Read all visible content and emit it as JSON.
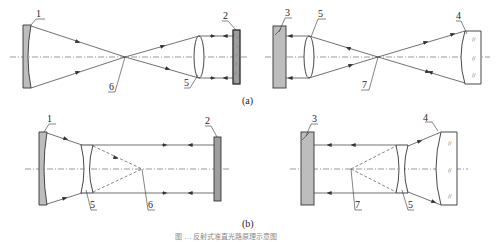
{
  "figure": {
    "subfigures": [
      {
        "id": "a",
        "label": "(a)",
        "left": {
          "labels": {
            "mirror": "1",
            "plate": "2",
            "lens": "5",
            "focus": "6"
          }
        },
        "right": {
          "labels": {
            "plate": "3",
            "lens": "5",
            "focus": "7",
            "mirror": "4"
          }
        }
      },
      {
        "id": "b",
        "label": "(b)",
        "left": {
          "labels": {
            "mirror": "1",
            "plate": "2",
            "lens": "5",
            "focus": "6"
          }
        },
        "right": {
          "labels": {
            "plate": "3",
            "lens": "5",
            "focus": "7",
            "mirror": "4"
          }
        }
      }
    ],
    "caption": "图 … 反射式准直光路原理示意图"
  },
  "colors": {
    "line": "#333333",
    "fill_grey": "#bdbdbd",
    "background": "#ffffff"
  }
}
